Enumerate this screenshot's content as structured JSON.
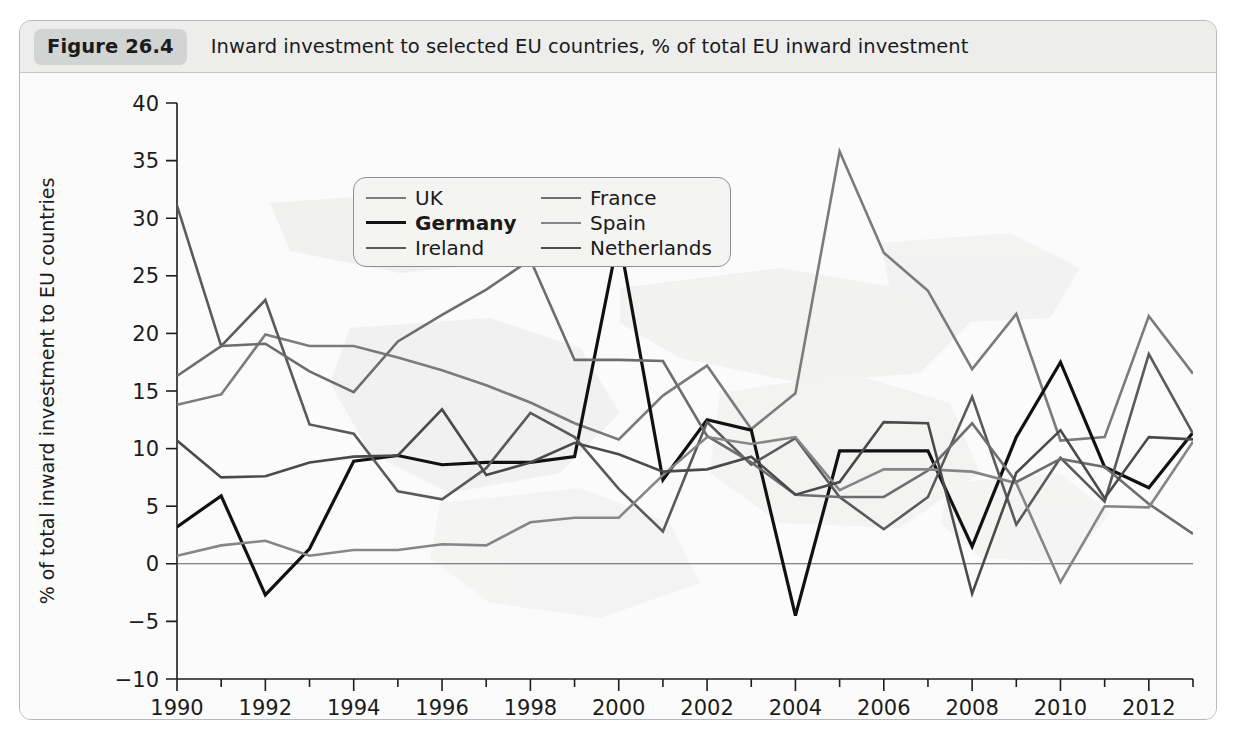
{
  "figure": {
    "badge": "Figure 26.4",
    "caption": "Inward investment to selected EU countries, % of total EU inward investment"
  },
  "legend": {
    "entries": [
      {
        "label": "UK",
        "color": "#7b7b7b",
        "width": 2.6,
        "bold": false
      },
      {
        "label": "France",
        "color": "#6d6d6d",
        "width": 2.6,
        "bold": false
      },
      {
        "label": "Germany",
        "color": "#111111",
        "width": 3.2,
        "bold": true
      },
      {
        "label": "Spain",
        "color": "#868686",
        "width": 2.6,
        "bold": false
      },
      {
        "label": "Ireland",
        "color": "#5a5a5a",
        "width": 2.6,
        "bold": false
      },
      {
        "label": "Netherlands",
        "color": "#4a4a4a",
        "width": 2.6,
        "bold": false
      }
    ]
  },
  "chart_data": {
    "type": "line",
    "title": "Inward investment to selected EU countries, % of total EU inward investment",
    "xlabel": "",
    "ylabel": "% of total inward investment to EU countries",
    "xlim": [
      1990,
      2013
    ],
    "ylim": [
      -10,
      40
    ],
    "xticks": [
      1990,
      1992,
      1994,
      1996,
      1998,
      2000,
      2002,
      2004,
      2006,
      2008,
      2010,
      2012
    ],
    "xtick_labels": [
      "1990",
      "1992",
      "1994",
      "1996",
      "1998",
      "2000",
      "2002",
      "2004",
      "2006",
      "2008",
      "2010",
      "2012"
    ],
    "xticks_minor": [
      1991,
      1993,
      1995,
      1997,
      1999,
      2001,
      2003,
      2005,
      2007,
      2009,
      2011,
      2013
    ],
    "yticks": [
      -10,
      -5,
      0,
      5,
      10,
      15,
      20,
      25,
      30,
      35,
      40
    ],
    "ytick_labels": [
      "−10",
      "−5",
      "0",
      "5",
      "10",
      "15",
      "20",
      "25",
      "30",
      "35",
      "40"
    ],
    "grid": false,
    "zero_line": true,
    "legend_position": "top-center",
    "x": [
      1990,
      1991,
      1992,
      1993,
      1994,
      1995,
      1996,
      1997,
      1998,
      1999,
      2000,
      2001,
      2002,
      2003,
      2004,
      2005,
      2006,
      2007,
      2008,
      2009,
      2010,
      2011,
      2012,
      2013
    ],
    "series": [
      {
        "name": "UK",
        "color": "#7b7b7b",
        "width": 2.6,
        "values": [
          13.8,
          14.7,
          19.9,
          18.9,
          18.9,
          17.9,
          16.8,
          15.5,
          14.0,
          12.2,
          10.8,
          14.6,
          17.2,
          11.7,
          14.8,
          35.8,
          27.0,
          23.7,
          16.9,
          21.7,
          10.7,
          11.0,
          21.5,
          16.5
        ]
      },
      {
        "name": "Germany",
        "color": "#111111",
        "width": 3.2,
        "values": [
          3.2,
          5.9,
          -2.7,
          1.3,
          8.9,
          9.4,
          8.6,
          8.8,
          8.8,
          9.3,
          28.5,
          7.3,
          12.5,
          11.6,
          -4.5,
          9.8,
          9.8,
          9.8,
          1.5,
          11.0,
          17.5,
          8.4,
          6.6,
          11.4
        ]
      },
      {
        "name": "Ireland",
        "color": "#5a5a5a",
        "width": 2.6,
        "values": [
          31.1,
          18.9,
          22.9,
          12.1,
          11.3,
          6.3,
          5.6,
          8.3,
          13.1,
          11.0,
          6.5,
          2.8,
          12.3,
          8.6,
          10.9,
          5.8,
          3.0,
          5.8,
          14.5,
          3.4,
          9.2,
          5.4,
          18.2,
          11.3
        ]
      },
      {
        "name": "France",
        "color": "#6d6d6d",
        "width": 2.6,
        "values": [
          16.3,
          18.9,
          19.1,
          16.7,
          14.9,
          19.3,
          21.6,
          23.8,
          26.4,
          17.7,
          17.7,
          17.6,
          11.1,
          8.8,
          6.0,
          5.8,
          5.8,
          8.1,
          12.2,
          7.1,
          9.1,
          8.4,
          5.2,
          2.6
        ]
      },
      {
        "name": "Spain",
        "color": "#868686",
        "width": 2.6,
        "values": [
          0.7,
          1.6,
          2.0,
          0.7,
          1.2,
          1.2,
          1.7,
          1.6,
          3.6,
          4.0,
          4.0,
          7.7,
          11.0,
          10.4,
          11.0,
          6.4,
          8.2,
          8.2,
          8.0,
          7.0,
          -1.6,
          5.0,
          4.9,
          10.6
        ]
      },
      {
        "name": "Netherlands",
        "color": "#4a4a4a",
        "width": 2.6,
        "values": [
          10.7,
          7.5,
          7.6,
          8.8,
          9.3,
          9.4,
          13.4,
          7.7,
          8.8,
          10.5,
          9.5,
          8.0,
          8.2,
          9.3,
          6.0,
          7.1,
          12.3,
          12.2,
          -2.6,
          7.9,
          11.6,
          5.7,
          11.0,
          10.8
        ]
      }
    ]
  }
}
